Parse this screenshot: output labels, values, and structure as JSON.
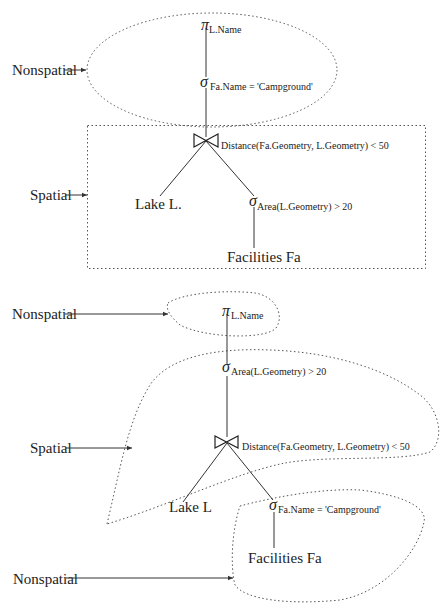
{
  "diagram": {
    "top_plan": {
      "regions": [
        {
          "kind": "Nonspatial",
          "shape": "ellipse"
        },
        {
          "kind": "Spatial",
          "shape": "rectangle"
        }
      ],
      "nodes": {
        "project": {
          "symbol": "π",
          "subscript": "L.Name"
        },
        "select_name": {
          "symbol": "σ",
          "subscript": "Fa.Name = 'Campground'"
        },
        "join": {
          "symbol": "⋈",
          "subscript": "Distance(Fa.Geometry, L.Geometry) < 50"
        },
        "lake": {
          "label": "Lake L."
        },
        "select_area": {
          "symbol": "σ",
          "subscript": "Area(L.Geometry) > 20"
        },
        "facilities": {
          "label": "Facilities Fa"
        }
      },
      "labels": {
        "nonspatial": "Nonspatial",
        "spatial": "Spatial"
      }
    },
    "bottom_plan": {
      "regions": [
        {
          "kind": "Nonspatial",
          "shape": "blob-top"
        },
        {
          "kind": "Spatial",
          "shape": "blob-middle"
        },
        {
          "kind": "Nonspatial",
          "shape": "blob-bottom"
        }
      ],
      "nodes": {
        "project": {
          "symbol": "π",
          "subscript": "L.Name"
        },
        "select_area": {
          "symbol": "σ",
          "subscript": "Area(L.Geometry) > 20"
        },
        "join": {
          "symbol": "⋈",
          "subscript": "Distance(Fa.Geometry, L.Geometry) < 50"
        },
        "lake": {
          "label": "Lake L"
        },
        "select_name": {
          "symbol": "σ",
          "subscript": "Fa.Name = 'Campground'"
        },
        "facilities": {
          "label": "Facilities Fa"
        }
      },
      "labels": {
        "nonspatial_top": "Nonspatial",
        "spatial": "Spatial",
        "nonspatial_bottom": "Nonspatial"
      }
    }
  }
}
